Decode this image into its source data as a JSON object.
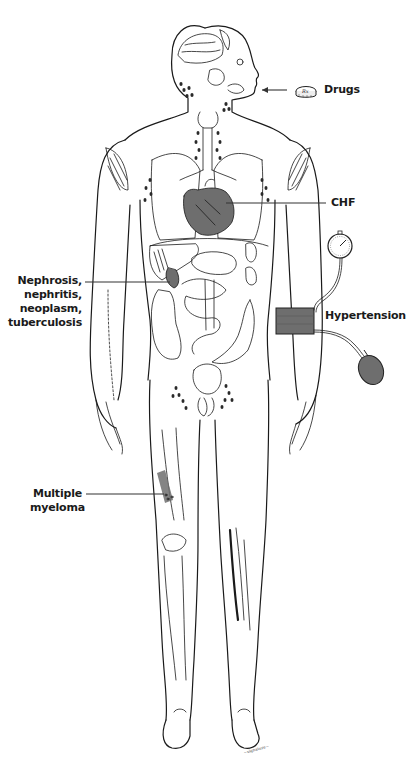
{
  "figure": {
    "labels": {
      "drugs": "Drugs",
      "chf": "CHF",
      "renal": [
        "Nephrosis,",
        "nephritis,",
        "neoplasm,",
        "tuberculosis"
      ],
      "hypertension": "Hypertension",
      "myeloma": [
        "Multiple",
        "myeloma"
      ]
    },
    "icons": {
      "pill": "pill-rx-icon",
      "pill_text": "Rx",
      "gauge": "sphygmomanometer-gauge-icon",
      "cuff": "blood-pressure-cuff-icon",
      "bulb": "inflation-bulb-icon"
    },
    "signature": "artist signature",
    "colors": {
      "line": "#1a1a1a",
      "highlight": "#6e6e6e",
      "background": "#ffffff"
    }
  }
}
